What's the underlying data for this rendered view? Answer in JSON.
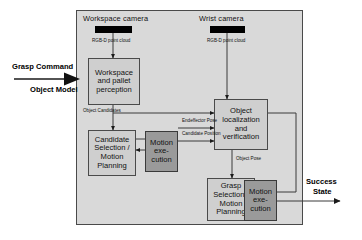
{
  "diagram": {
    "title_bar_labels": {
      "workspace_camera": "Workspace camera",
      "wrist_camera": "Wrist camera"
    },
    "nodes": [
      {
        "id": "workspace_perception",
        "label_lines": [
          "Workspace",
          "and pallet",
          "perception"
        ],
        "style": "light"
      },
      {
        "id": "candidate_selection",
        "label_lines": [
          "Candidate",
          "Selection /",
          "Motion",
          "Planning"
        ],
        "style": "light"
      },
      {
        "id": "motion_execution_left",
        "label_lines": [
          "Motion",
          "exe-",
          "cution"
        ],
        "style": "dark"
      },
      {
        "id": "object_localization",
        "label_lines": [
          "Object",
          "localization",
          "and",
          "verification"
        ],
        "style": "light"
      },
      {
        "id": "grasp_selection",
        "label_lines": [
          "Grasp",
          "Selection /",
          "Motion",
          "Planning"
        ],
        "style": "light"
      },
      {
        "id": "motion_execution_right",
        "label_lines": [
          "Motion",
          "exe-",
          "cution"
        ],
        "style": "dark"
      }
    ],
    "edge_labels": [
      {
        "id": "rgbd_workspace",
        "lines": [
          "RGB-D",
          "point cloud"
        ]
      },
      {
        "id": "rgbd_wrist",
        "lines": [
          "RGB-D",
          "point cloud"
        ]
      },
      {
        "id": "object_candidates",
        "lines": [
          "Object",
          "Candidates"
        ]
      },
      {
        "id": "endeffector_pose",
        "lines": [
          "Endeffector",
          "Pose"
        ]
      },
      {
        "id": "candidate_position",
        "lines": [
          "Candidate",
          "Position"
        ]
      },
      {
        "id": "object_pose",
        "lines": [
          "Object",
          "Pose"
        ]
      }
    ],
    "external_labels": [
      {
        "id": "grasp_command",
        "text": "Grasp Command"
      },
      {
        "id": "object_model",
        "text": "Object Model"
      },
      {
        "id": "success_line1",
        "text": "Success"
      },
      {
        "id": "success_line2",
        "text": "State"
      }
    ],
    "colors": {
      "panel_fill": "#d9d9d9",
      "node_light": "#cfcfcf",
      "node_dark": "#9a9a9a",
      "stroke": "#4a4a4a",
      "camera_bar": "#000000"
    }
  }
}
